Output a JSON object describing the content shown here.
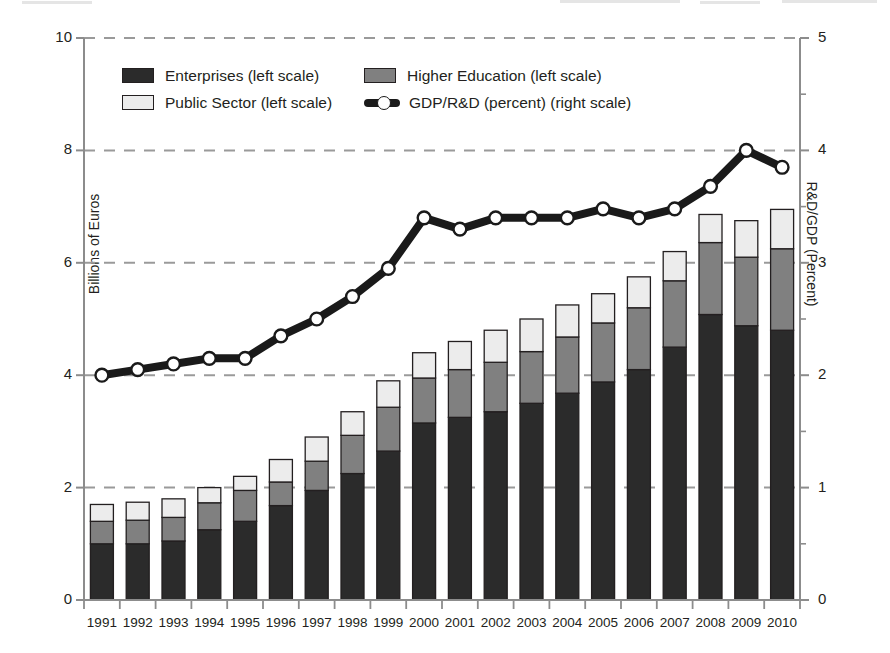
{
  "chart_data": {
    "type": "bar",
    "title": "",
    "subtitle": "",
    "xlabel": "",
    "ylabel": "Billions of Euros",
    "y2label": "R&D/GDP (Percent)",
    "ylim": [
      0,
      10
    ],
    "y2lim": [
      0,
      5
    ],
    "yticks": [
      0,
      2,
      4,
      6,
      8,
      10
    ],
    "y2ticks": [
      0,
      1,
      2,
      3,
      4,
      5
    ],
    "y2minorticks": [
      0.5,
      1.5,
      2.5,
      3.5,
      4.5
    ],
    "grid": "horizontal-dashed",
    "legend_position": "upper-left-inside",
    "stacked": true,
    "categories": [
      "1991",
      "1992",
      "1993",
      "1994",
      "1995",
      "1996",
      "1997",
      "1998",
      "1999",
      "2000",
      "2001",
      "2002",
      "2003",
      "2004",
      "2005",
      "2006",
      "2007",
      "2008",
      "2009",
      "2010"
    ],
    "series": [
      {
        "name": "Enterprises (left scale)",
        "axis": "left",
        "type": "bar",
        "color": "#2b2b2b",
        "values": [
          1.0,
          1.0,
          1.05,
          1.25,
          1.4,
          1.68,
          1.95,
          2.25,
          2.65,
          3.15,
          3.25,
          3.35,
          3.5,
          3.68,
          3.88,
          4.1,
          4.5,
          5.08,
          4.88,
          4.8
        ]
      },
      {
        "name": "Higher Education (left scale)",
        "axis": "left",
        "type": "bar",
        "color": "#808080",
        "values": [
          0.4,
          0.42,
          0.42,
          0.48,
          0.55,
          0.42,
          0.52,
          0.68,
          0.78,
          0.8,
          0.85,
          0.88,
          0.92,
          1.0,
          1.05,
          1.1,
          1.18,
          1.28,
          1.22,
          1.45
        ]
      },
      {
        "name": "Public Sector (left scale)",
        "axis": "left",
        "type": "bar",
        "color": "#ececec",
        "values": [
          0.3,
          0.32,
          0.33,
          0.27,
          0.25,
          0.4,
          0.43,
          0.42,
          0.47,
          0.45,
          0.5,
          0.57,
          0.58,
          0.57,
          0.52,
          0.55,
          0.52,
          0.5,
          0.65,
          0.7
        ]
      },
      {
        "name": "GDP/R&D (percent) (right scale)",
        "axis": "right",
        "type": "line",
        "color": "#1a1a1a",
        "marker": "circle-white-fill",
        "values": [
          2.0,
          2.05,
          2.1,
          2.15,
          2.15,
          2.35,
          2.5,
          2.7,
          2.95,
          3.4,
          3.3,
          3.4,
          3.4,
          3.4,
          3.48,
          3.4,
          3.48,
          3.68,
          4.0,
          3.85
        ]
      }
    ],
    "totals": [
      1.7,
      1.74,
      1.8,
      2.0,
      2.2,
      2.5,
      2.9,
      3.35,
      3.9,
      4.4,
      4.6,
      4.8,
      5.0,
      5.25,
      5.45,
      5.75,
      6.2,
      6.86,
      6.75,
      6.95
    ]
  },
  "axes": {
    "left_title": "Billions of Euros",
    "right_title": "R&D/GDP (Percent)",
    "left_ticks": [
      "0",
      "2",
      "4",
      "6",
      "8",
      "10"
    ],
    "right_ticks": [
      "0",
      "1",
      "2",
      "3",
      "4",
      "5"
    ],
    "x_ticks": [
      "1991",
      "1992",
      "1993",
      "1994",
      "1995",
      "1996",
      "1997",
      "1998",
      "1999",
      "2000",
      "2001",
      "2002",
      "2003",
      "2004",
      "2005",
      "2006",
      "2007",
      "2008",
      "2009",
      "2010"
    ]
  },
  "legend": {
    "items": [
      {
        "label": "Enterprises (left scale)",
        "swatch": "enterprises-swatch",
        "color": "#2b2b2b"
      },
      {
        "label": "Higher Education (left scale)",
        "swatch": "higher-education-swatch",
        "color": "#808080"
      },
      {
        "label": "Public Sector (left scale)",
        "swatch": "public-sector-swatch",
        "color": "#ececec"
      },
      {
        "label": "GDP/R&D (percent) (right scale)",
        "swatch": "gdp-rd-line-marker",
        "color": "#1a1a1a"
      }
    ]
  },
  "colors": {
    "enterprises": "#2b2b2b",
    "higher_education": "#808080",
    "public_sector": "#ececec",
    "line": "#1a1a1a",
    "grid": "#9a9a9a",
    "axis": "#8c8c8c",
    "text": "#231f20",
    "background": "#ffffff"
  }
}
